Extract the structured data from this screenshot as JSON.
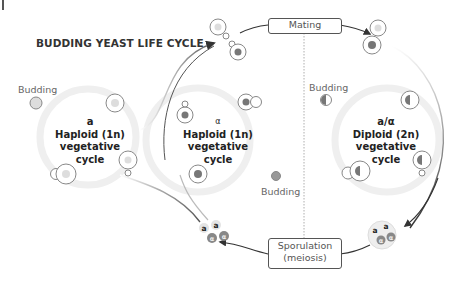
{
  "title": "BUDDING YEAST LIFE CYCLE",
  "cycles": [
    {
      "symbol": "a",
      "line1": "Haploid (1n)",
      "line2": "vegetative",
      "line3": "cycle"
    },
    {
      "symbol": "α",
      "line1": "Haploid (1n)",
      "line2": "vegetative",
      "line3": "cycle"
    },
    {
      "symbol": "a/α",
      "line1": "Diploid (2n)",
      "line2": "vegetative",
      "line3": "cycle"
    }
  ],
  "budding_labels": [
    "Budding",
    "Budding",
    "Budding"
  ],
  "boxes": {
    "mating": "Mating",
    "sporulation_line1": "Sporulation",
    "sporulation_line2": "(meiosis)"
  },
  "spores": {
    "a": "a",
    "alpha": "α"
  },
  "colors": {
    "cell_outline": "#888888",
    "nucleus_a": "#cccccc",
    "nucleus_alpha": "#777777",
    "arrow": "#333333",
    "cycle_ring": "#eeeeee"
  }
}
